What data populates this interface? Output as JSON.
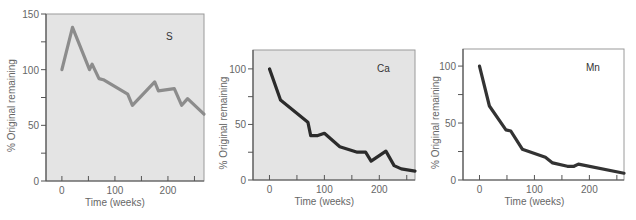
{
  "chart_data": [
    {
      "type": "line",
      "title": "S",
      "xlabel": "Time (weeks)",
      "ylabel": "% Original remaining",
      "xlim": [
        -30,
        268
      ],
      "ylim": [
        0,
        150
      ],
      "xticks": [
        0,
        100,
        200
      ],
      "xminor_ticks": [
        0,
        50,
        100,
        150,
        200,
        250
      ],
      "yticks": [
        0,
        50,
        100,
        150
      ],
      "yminor_ticks": [
        0,
        25,
        50,
        75,
        100,
        125,
        150
      ],
      "grid": false,
      "background": "#e4e4e4",
      "line_color": "#8c8c8c",
      "series": [
        {
          "name": "S",
          "x": [
            0,
            20,
            52,
            57,
            70,
            78,
            124,
            133,
            175,
            182,
            212,
            226,
            237,
            268
          ],
          "y": [
            100,
            138,
            100,
            105,
            92,
            91,
            78,
            68,
            89,
            81,
            83,
            68,
            74,
            60
          ]
        }
      ]
    },
    {
      "type": "line",
      "title": "Ca",
      "xlabel": "Time (weeks)",
      "ylabel": "% Original remaining",
      "xlim": [
        -30,
        265
      ],
      "ylim": [
        0,
        117
      ],
      "xticks": [
        0,
        100,
        200
      ],
      "xminor_ticks": [
        0,
        50,
        100,
        150,
        200,
        250
      ],
      "yticks": [
        0,
        50,
        100
      ],
      "yminor_ticks": [
        0,
        25,
        50,
        75,
        100
      ],
      "grid": false,
      "background": "#e4e4e4",
      "line_color": "#2b2b2b",
      "series": [
        {
          "name": "Ca",
          "x": [
            0,
            20,
            70,
            75,
            88,
            100,
            128,
            160,
            175,
            185,
            212,
            227,
            240,
            265
          ],
          "y": [
            100,
            72,
            52,
            40,
            40,
            42,
            30,
            25,
            25,
            17,
            26,
            13,
            10,
            8
          ]
        }
      ]
    },
    {
      "type": "line",
      "title": "Mn",
      "xlabel": "Time (weeks)",
      "ylabel": "% Original remaining",
      "xlim": [
        -30,
        263
      ],
      "ylim": [
        0,
        115
      ],
      "xticks": [
        0,
        100,
        200
      ],
      "xminor_ticks": [
        0,
        50,
        100,
        150,
        200,
        250
      ],
      "yticks": [
        0,
        50,
        100
      ],
      "yminor_ticks": [
        0,
        25,
        50,
        75,
        100
      ],
      "grid": false,
      "background": "#ffffff",
      "line_color": "#333333",
      "series": [
        {
          "name": "Mn",
          "x": [
            0,
            18,
            48,
            57,
            78,
            120,
            133,
            160,
            172,
            180,
            263
          ],
          "y": [
            100,
            65,
            44,
            43,
            27,
            20,
            15,
            12,
            12,
            14,
            6
          ]
        }
      ]
    }
  ]
}
